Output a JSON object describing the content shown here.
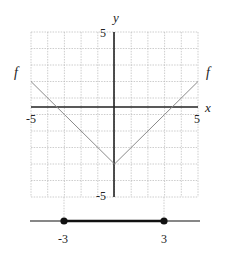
{
  "chart_data": {
    "type": "line",
    "title": "",
    "xlabel": "x",
    "ylabel": "y",
    "xlim": [
      -5,
      5
    ],
    "ylim": [
      -5,
      5
    ],
    "grid": true,
    "grid_step": 1,
    "tick_labels": {
      "x_min": "-5",
      "x_max": "5",
      "y_max": "5",
      "y_min": "-5"
    },
    "series": [
      {
        "name": "f",
        "x": [
          -5,
          -3,
          0,
          3,
          5
        ],
        "y": [
          2,
          0,
          -3,
          0,
          2
        ],
        "color": "#8a8a8a"
      }
    ],
    "annotations": [
      {
        "text": "f",
        "position": "left end of curve"
      },
      {
        "text": "f",
        "position": "right end of curve"
      }
    ],
    "number_line": {
      "interval": [
        -3,
        3
      ],
      "closed_left": true,
      "closed_right": true,
      "labels": [
        "-3",
        "3"
      ]
    }
  },
  "labels": {
    "x_axis": "x",
    "y_axis": "y",
    "f_left": "f",
    "f_right": "f",
    "tick_x_min": "-5",
    "tick_x_max": "5",
    "tick_y_max": "5",
    "tick_y_min": "-5",
    "nl_left": "-3",
    "nl_right": "3"
  },
  "colors": {
    "grid": "#b8b8b8",
    "axis": "#222222",
    "curve": "#8a8a8a",
    "number_line": "#111111"
  }
}
